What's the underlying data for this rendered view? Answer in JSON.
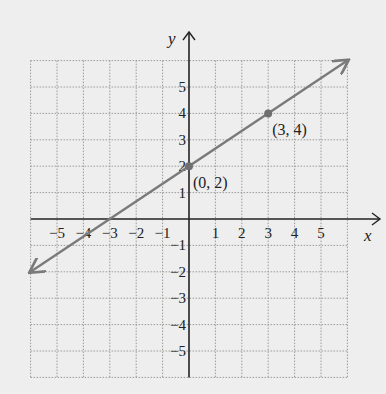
{
  "chart_data": {
    "type": "line",
    "title": "",
    "xlabel": "x",
    "ylabel": "y",
    "xlim": [
      -6,
      6
    ],
    "ylim": [
      -6,
      6
    ],
    "grid": true,
    "x_ticks": [
      -5,
      -4,
      -3,
      -2,
      -1,
      1,
      2,
      3,
      4,
      5
    ],
    "y_ticks": [
      -5,
      -4,
      -3,
      -2,
      -1,
      1,
      2,
      3,
      4,
      5
    ],
    "x_tick_labels": [
      "−5",
      "−4",
      "−3",
      "−2",
      "−1",
      "1",
      "2",
      "3",
      "4",
      "5"
    ],
    "y_tick_labels": [
      "−5",
      "−4",
      "−3",
      "−2",
      "−1",
      "1",
      "2",
      "3",
      "4",
      "5"
    ],
    "series": [
      {
        "name": "line through (0, 2) and (3, 4)",
        "equation": "y = (2/3)x + 2",
        "x": [
          -6,
          6
        ],
        "y": [
          -2,
          6
        ],
        "arrows": "both",
        "color": "#7a7a7a"
      }
    ],
    "points": [
      {
        "x": 0,
        "y": 2,
        "label": "(0, 2)"
      },
      {
        "x": 3,
        "y": 4,
        "label": "(3, 4)"
      }
    ],
    "x_intercept": -3,
    "y_intercept": 2
  },
  "colors": {
    "background": "#eeeeee",
    "axis": "#222222",
    "grid": "#9a9a9a",
    "line": "#7a7a7a",
    "point": "#6f6f6f"
  }
}
